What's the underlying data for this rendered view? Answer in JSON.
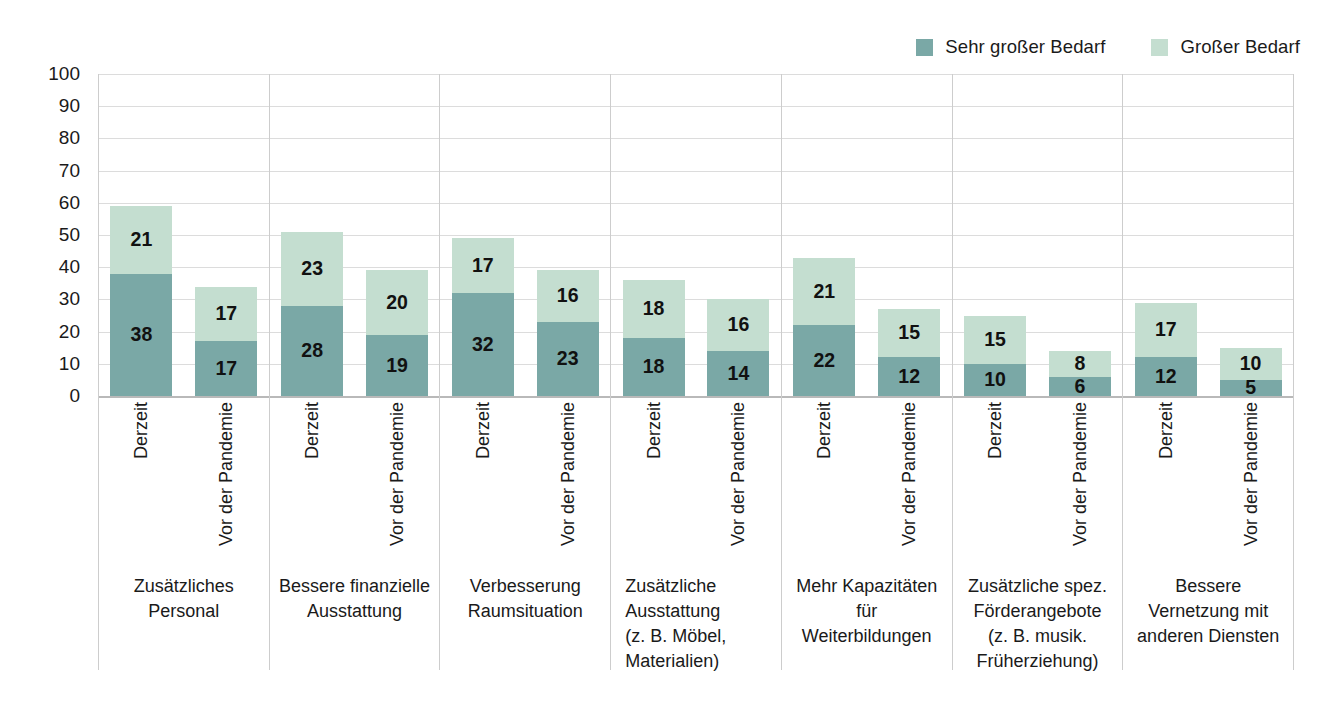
{
  "legend": {
    "position": "top-right",
    "entries": [
      {
        "label": "Sehr großer Bedarf",
        "color": "#7aa8a6",
        "icon": "legend-swatch-icon"
      },
      {
        "label": "Großer Bedarf",
        "color": "#c4ded0",
        "icon": "legend-swatch-icon"
      }
    ]
  },
  "axis": {
    "ticks": [
      "100",
      "90",
      "80",
      "70",
      "60",
      "50",
      "40",
      "30",
      "20",
      "10",
      "0"
    ]
  },
  "series_labels": {
    "current": "Derzeit",
    "prepandemic": "Vor der Pandemie"
  },
  "chart_data": {
    "type": "bar",
    "stacked": true,
    "grouped": true,
    "title": "",
    "xlabel": "",
    "ylabel": "",
    "ylim": [
      0,
      100
    ],
    "ytick_step": 10,
    "grid": true,
    "legend_position": "top-right",
    "group_series": [
      "Derzeit",
      "Vor der Pandemie"
    ],
    "series": [
      {
        "name": "Sehr großer Bedarf",
        "color": "#7aa8a6"
      },
      {
        "name": "Großer Bedarf",
        "color": "#c4ded0"
      }
    ],
    "categories": [
      {
        "lines": [
          "Zusätzliches",
          "Personal"
        ],
        "align": "center",
        "bars": [
          {
            "label": "Derzeit",
            "sehr_grosser_bedarf": 38,
            "grosser_bedarf": 21,
            "total": 59
          },
          {
            "label": "Vor der Pandemie",
            "sehr_grosser_bedarf": 17,
            "grosser_bedarf": 17,
            "total": 34
          }
        ]
      },
      {
        "lines": [
          "Bessere finanzielle",
          "Ausstattung"
        ],
        "align": "center",
        "bars": [
          {
            "label": "Derzeit",
            "sehr_grosser_bedarf": 28,
            "grosser_bedarf": 23,
            "total": 51
          },
          {
            "label": "Vor der Pandemie",
            "sehr_grosser_bedarf": 19,
            "grosser_bedarf": 20,
            "total": 39
          }
        ]
      },
      {
        "lines": [
          "Verbesserung",
          "Raumsituation"
        ],
        "align": "center",
        "bars": [
          {
            "label": "Derzeit",
            "sehr_grosser_bedarf": 32,
            "grosser_bedarf": 17,
            "total": 49
          },
          {
            "label": "Vor der Pandemie",
            "sehr_grosser_bedarf": 23,
            "grosser_bedarf": 16,
            "total": 39
          }
        ]
      },
      {
        "lines": [
          "Zusätzliche",
          "Ausstattung",
          "(z. B. Möbel,",
          "Materialien)"
        ],
        "align": "left",
        "bars": [
          {
            "label": "Derzeit",
            "sehr_grosser_bedarf": 18,
            "grosser_bedarf": 18,
            "total": 36
          },
          {
            "label": "Vor der Pandemie",
            "sehr_grosser_bedarf": 14,
            "grosser_bedarf": 16,
            "total": 30
          }
        ]
      },
      {
        "lines": [
          "Mehr Kapazitäten",
          "für",
          "Weiterbildungen"
        ],
        "align": "center",
        "bars": [
          {
            "label": "Derzeit",
            "sehr_grosser_bedarf": 22,
            "grosser_bedarf": 21,
            "total": 43
          },
          {
            "label": "Vor der Pandemie",
            "sehr_grosser_bedarf": 12,
            "grosser_bedarf": 15,
            "total": 27
          }
        ]
      },
      {
        "lines": [
          "Zusätzliche spez.",
          "Förderangebote",
          "(z. B. musik.",
          "Früherziehung)"
        ],
        "align": "center",
        "bars": [
          {
            "label": "Derzeit",
            "sehr_grosser_bedarf": 10,
            "grosser_bedarf": 15,
            "total": 25
          },
          {
            "label": "Vor der Pandemie",
            "sehr_grosser_bedarf": 6,
            "grosser_bedarf": 8,
            "total": 14
          }
        ]
      },
      {
        "lines": [
          "Bessere",
          "Vernetzung mit",
          "anderen Diensten"
        ],
        "align": "center",
        "bars": [
          {
            "label": "Derzeit",
            "sehr_grosser_bedarf": 12,
            "grosser_bedarf": 17,
            "total": 29
          },
          {
            "label": "Vor der Pandemie",
            "sehr_grosser_bedarf": 5,
            "grosser_bedarf": 10,
            "total": 15
          }
        ]
      }
    ]
  }
}
